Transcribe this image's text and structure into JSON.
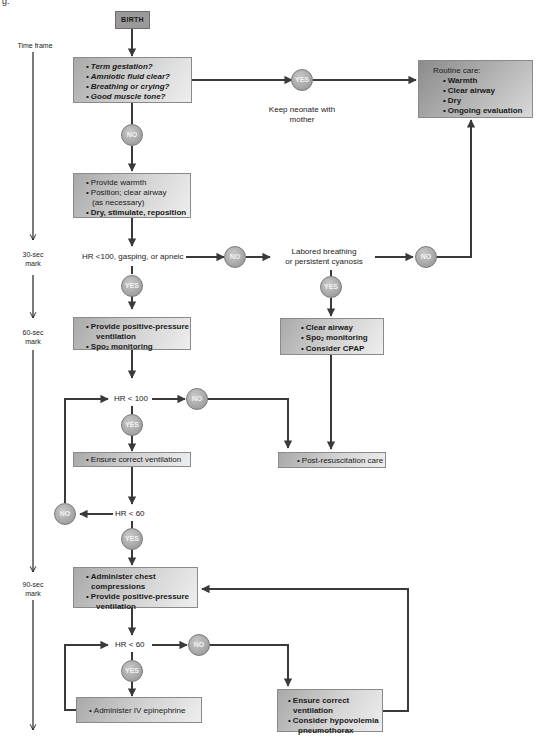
{
  "caption_fragment": "g.",
  "timeline": {
    "title": "Time frame",
    "marks": [
      {
        "line1": "30-sec",
        "line2": "mark"
      },
      {
        "line1": "60-sec",
        "line2": "mark"
      },
      {
        "line1": "90-sec",
        "line2": "mark"
      }
    ]
  },
  "nodes": {
    "birth": "BIRTH",
    "initial_questions": [
      "Term gestation?",
      "Amniotic fluid clear?",
      "Breathing or crying?",
      "Good muscle tone?"
    ],
    "keep_with_mother": "Keep neonate with mother",
    "routine_care": {
      "heading": "Routine care:",
      "items": [
        "Warmth",
        "Clear airway",
        "Dry",
        "Ongoing evaluation"
      ]
    },
    "initial_steps": {
      "items": [
        "Provide warmth",
        "Position; clear airway",
        "(as necessary)",
        "Dry, stimulate, reposition"
      ]
    },
    "hr100_gasping": "HR <100, gasping, or apneic",
    "labored_breathing": {
      "line1": "Labored breathing",
      "line2": "or persistent cyanosis"
    },
    "ppv_box": {
      "item1": "Provide positive-pressure",
      "item1b": "ventilation",
      "item2_prefix": "Spo",
      "item2_sub": "2",
      "item2_suffix": " monitoring"
    },
    "cpap_box": {
      "item1": "Clear airway",
      "item2_prefix": "Spo",
      "item2_sub": "2",
      "item2_suffix": " monitoring",
      "item3": "Consider CPAP"
    },
    "hr_lt_100": "HR < 100",
    "ensure_ventilation_1": "Ensure correct ventilation",
    "post_resus": "Post-resuscitation care",
    "hr_lt_60_a": "HR < 60",
    "compressions_box": {
      "item1": "Administer chest compressions",
      "item2": "Provide positive-pressure",
      "item2b": "ventilation"
    },
    "hr_lt_60_b": "HR < 60",
    "epinephrine": "Administer IV epinephrine",
    "final_box": {
      "item1": "Ensure correct ventilation",
      "item2": "Consider hypovolemia",
      "item2b": "pneumothorax"
    }
  },
  "decisions": {
    "yes": "YES",
    "no": "NO"
  },
  "colors": {
    "line": "#3a3a3a",
    "circle": "#a8a8a8",
    "box_light": "#d4d4d4",
    "box_dark": "#9a9a9a"
  }
}
